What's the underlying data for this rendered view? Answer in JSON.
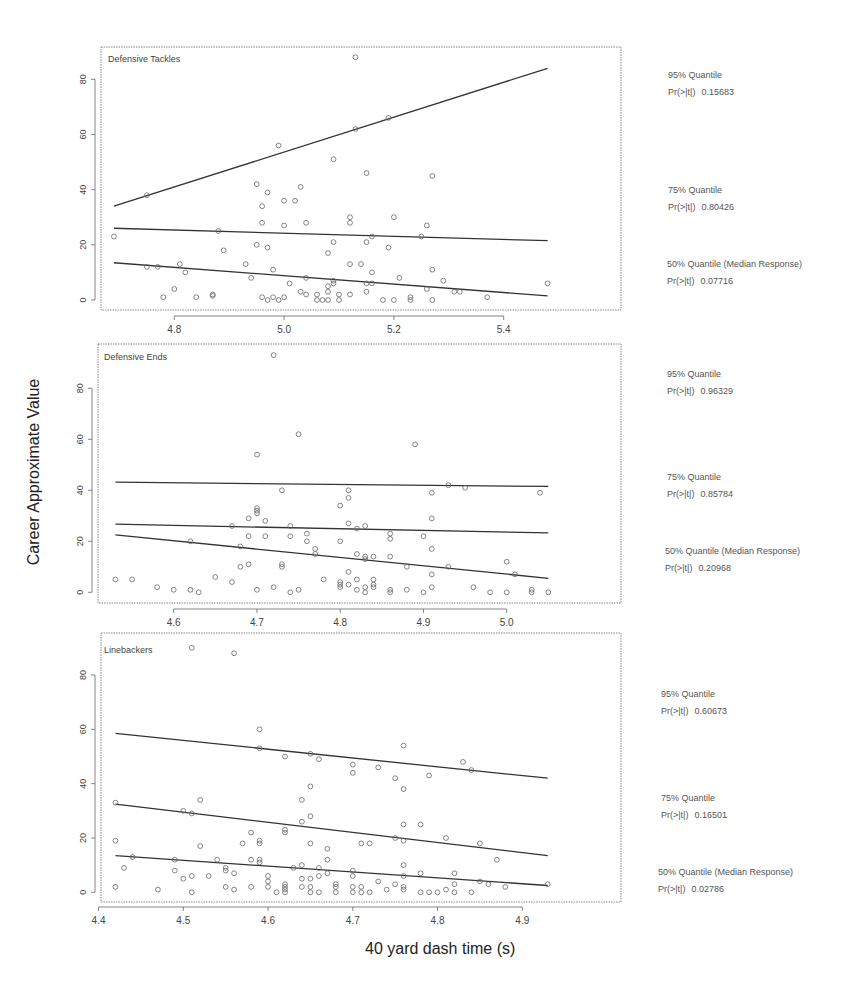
{
  "figure": {
    "ylabel": "Career Approximate Value",
    "xlabel": "40 yard dash time (s)"
  },
  "chart_data": [
    {
      "type": "scatter",
      "title": "Defensive Tackles",
      "xlabel": "40 yard dash time (s)",
      "ylabel": "Career Approximate Value",
      "xticks": [
        4.8,
        5.0,
        5.2,
        5.4
      ],
      "yticks": [
        0,
        20,
        40,
        60,
        80
      ],
      "xlim": [
        4.67,
        5.51
      ],
      "ylim": [
        -2.5,
        92
      ],
      "grid": false,
      "points": [
        [
          4.69,
          23
        ],
        [
          4.75,
          38
        ],
        [
          4.75,
          12
        ],
        [
          4.77,
          12
        ],
        [
          4.78,
          1
        ],
        [
          4.8,
          4
        ],
        [
          4.81,
          13
        ],
        [
          4.82,
          10
        ],
        [
          4.84,
          1
        ],
        [
          4.87,
          1.5
        ],
        [
          4.87,
          2
        ],
        [
          4.88,
          25
        ],
        [
          4.89,
          18
        ],
        [
          4.93,
          13
        ],
        [
          4.94,
          8
        ],
        [
          4.95,
          42
        ],
        [
          4.95,
          20
        ],
        [
          4.96,
          34
        ],
        [
          4.96,
          28
        ],
        [
          4.96,
          1
        ],
        [
          4.97,
          39
        ],
        [
          4.97,
          19
        ],
        [
          4.97,
          0
        ],
        [
          4.98,
          11
        ],
        [
          4.98,
          1
        ],
        [
          4.99,
          56
        ],
        [
          4.99,
          0
        ],
        [
          5.0,
          36
        ],
        [
          5.0,
          27
        ],
        [
          5.0,
          1
        ],
        [
          5.01,
          6
        ],
        [
          5.02,
          36
        ],
        [
          5.03,
          41
        ],
        [
          5.03,
          3
        ],
        [
          5.04,
          28
        ],
        [
          5.04,
          8
        ],
        [
          5.04,
          2
        ],
        [
          5.06,
          2
        ],
        [
          5.06,
          0
        ],
        [
          5.07,
          0
        ],
        [
          5.08,
          17
        ],
        [
          5.08,
          5
        ],
        [
          5.08,
          3
        ],
        [
          5.08,
          0
        ],
        [
          5.09,
          51
        ],
        [
          5.09,
          21
        ],
        [
          5.09,
          7
        ],
        [
          5.09,
          6
        ],
        [
          5.1,
          2
        ],
        [
          5.1,
          0
        ],
        [
          5.12,
          30
        ],
        [
          5.12,
          28
        ],
        [
          5.12,
          13
        ],
        [
          5.12,
          2
        ],
        [
          5.13,
          88
        ],
        [
          5.13,
          62
        ],
        [
          5.14,
          13
        ],
        [
          5.15,
          46
        ],
        [
          5.15,
          21
        ],
        [
          5.15,
          6
        ],
        [
          5.15,
          3
        ],
        [
          5.16,
          23
        ],
        [
          5.16,
          10
        ],
        [
          5.16,
          6
        ],
        [
          5.18,
          0
        ],
        [
          5.19,
          66
        ],
        [
          5.19,
          19
        ],
        [
          5.2,
          30
        ],
        [
          5.2,
          0
        ],
        [
          5.21,
          8
        ],
        [
          5.23,
          1
        ],
        [
          5.23,
          0
        ],
        [
          5.25,
          23
        ],
        [
          5.26,
          27
        ],
        [
          5.26,
          4
        ],
        [
          5.27,
          45
        ],
        [
          5.27,
          11
        ],
        [
          5.27,
          0
        ],
        [
          5.29,
          7
        ],
        [
          5.31,
          3
        ],
        [
          5.32,
          3
        ],
        [
          5.37,
          1
        ],
        [
          5.48,
          6
        ]
      ],
      "quantile_lines": [
        {
          "name": "95% Quantile",
          "x": [
            4.69,
            5.48
          ],
          "y": [
            34,
            84
          ],
          "p_value_label": "Pr(>|t|)",
          "p_value": "0.15683"
        },
        {
          "name": "75% Quantile",
          "x": [
            4.69,
            5.48
          ],
          "y": [
            26,
            21.5
          ],
          "p_value_label": "Pr(>|t|)",
          "p_value": "0.80426"
        },
        {
          "name": "50% Quantile (Median Response)",
          "x": [
            4.69,
            5.48
          ],
          "y": [
            13.5,
            1.5
          ],
          "p_value_label": "Pr(>|t|)",
          "p_value": "0.07716"
        }
      ]
    },
    {
      "type": "scatter",
      "title": "Defensive Ends",
      "xlabel": "40 yard dash time (s)",
      "ylabel": "Career Approximate Value",
      "xticks": [
        4.6,
        4.7,
        4.8,
        4.9,
        5.0
      ],
      "yticks": [
        0,
        20,
        40,
        60,
        80
      ],
      "xlim": [
        4.51,
        5.06
      ],
      "ylim": [
        -4,
        97
      ],
      "grid": false,
      "points": [
        [
          4.53,
          5
        ],
        [
          4.55,
          5
        ],
        [
          4.58,
          2
        ],
        [
          4.6,
          1
        ],
        [
          4.62,
          1
        ],
        [
          4.62,
          20
        ],
        [
          4.63,
          0
        ],
        [
          4.65,
          6
        ],
        [
          4.67,
          4
        ],
        [
          4.67,
          26
        ],
        [
          4.68,
          18
        ],
        [
          4.68,
          10
        ],
        [
          4.69,
          29
        ],
        [
          4.69,
          22
        ],
        [
          4.69,
          11
        ],
        [
          4.7,
          54
        ],
        [
          4.7,
          33
        ],
        [
          4.7,
          32
        ],
        [
          4.7,
          31
        ],
        [
          4.7,
          1
        ],
        [
          4.71,
          28
        ],
        [
          4.71,
          22
        ],
        [
          4.72,
          93
        ],
        [
          4.72,
          2
        ],
        [
          4.73,
          40
        ],
        [
          4.73,
          11
        ],
        [
          4.73,
          10
        ],
        [
          4.74,
          26
        ],
        [
          4.74,
          22
        ],
        [
          4.74,
          0
        ],
        [
          4.75,
          62
        ],
        [
          4.75,
          1
        ],
        [
          4.76,
          23
        ],
        [
          4.76,
          20
        ],
        [
          4.77,
          17
        ],
        [
          4.77,
          15
        ],
        [
          4.78,
          5
        ],
        [
          4.8,
          34
        ],
        [
          4.8,
          20
        ],
        [
          4.8,
          4
        ],
        [
          4.8,
          3
        ],
        [
          4.8,
          2
        ],
        [
          4.81,
          40
        ],
        [
          4.81,
          37
        ],
        [
          4.81,
          27
        ],
        [
          4.81,
          8
        ],
        [
          4.81,
          3
        ],
        [
          4.82,
          25
        ],
        [
          4.82,
          15
        ],
        [
          4.82,
          5
        ],
        [
          4.82,
          1
        ],
        [
          4.83,
          26
        ],
        [
          4.83,
          14
        ],
        [
          4.83,
          13
        ],
        [
          4.83,
          2
        ],
        [
          4.83,
          0
        ],
        [
          4.84,
          14
        ],
        [
          4.84,
          5
        ],
        [
          4.84,
          3
        ],
        [
          4.84,
          2
        ],
        [
          4.86,
          23
        ],
        [
          4.86,
          21
        ],
        [
          4.86,
          14
        ],
        [
          4.86,
          1
        ],
        [
          4.86,
          0
        ],
        [
          4.88,
          10
        ],
        [
          4.88,
          1
        ],
        [
          4.89,
          58
        ],
        [
          4.9,
          22
        ],
        [
          4.9,
          0
        ],
        [
          4.91,
          39
        ],
        [
          4.91,
          29
        ],
        [
          4.91,
          17
        ],
        [
          4.91,
          7
        ],
        [
          4.91,
          2
        ],
        [
          4.93,
          42
        ],
        [
          4.93,
          10
        ],
        [
          4.95,
          41
        ],
        [
          4.96,
          2
        ],
        [
          4.98,
          0
        ],
        [
          5.0,
          12
        ],
        [
          5.0,
          0
        ],
        [
          5.01,
          7
        ],
        [
          5.03,
          1
        ],
        [
          5.03,
          0
        ],
        [
          5.04,
          39
        ],
        [
          5.05,
          0
        ]
      ],
      "quantile_lines": [
        {
          "name": "95% Quantile",
          "x": [
            4.53,
            5.05
          ],
          "y": [
            43.2,
            41.5
          ],
          "p_value_label": "Pr(>|t|)",
          "p_value": "0.96329"
        },
        {
          "name": "75% Quantile",
          "x": [
            4.53,
            5.05
          ],
          "y": [
            26.7,
            23.3
          ],
          "p_value_label": "Pr(>|t|)",
          "p_value": "0.85784"
        },
        {
          "name": "50% Quantile (Median Response)",
          "x": [
            4.53,
            5.05
          ],
          "y": [
            22.5,
            5.5
          ],
          "p_value_label": "Pr(>|t|)",
          "p_value": "0.20968"
        }
      ]
    },
    {
      "type": "scatter",
      "title": "Linebackers",
      "xlabel": "40 yard dash time (s)",
      "ylabel": "Career Approximate Value",
      "xticks": [
        4.4,
        4.5,
        4.6,
        4.7,
        4.8,
        4.9
      ],
      "yticks": [
        0,
        20,
        40,
        60,
        80
      ],
      "xlim": [
        4.4,
        4.95
      ],
      "ylim": [
        -4,
        94
      ],
      "grid": false,
      "points": [
        [
          4.42,
          19
        ],
        [
          4.42,
          2
        ],
        [
          4.42,
          33
        ],
        [
          4.43,
          9
        ],
        [
          4.44,
          13
        ],
        [
          4.47,
          1
        ],
        [
          4.49,
          12
        ],
        [
          4.49,
          8
        ],
        [
          4.5,
          30
        ],
        [
          4.5,
          5
        ],
        [
          4.51,
          90
        ],
        [
          4.51,
          29
        ],
        [
          4.51,
          6
        ],
        [
          4.51,
          0
        ],
        [
          4.52,
          34
        ],
        [
          4.52,
          17
        ],
        [
          4.53,
          6
        ],
        [
          4.54,
          12
        ],
        [
          4.55,
          9
        ],
        [
          4.55,
          8
        ],
        [
          4.55,
          2
        ],
        [
          4.56,
          88
        ],
        [
          4.56,
          7
        ],
        [
          4.56,
          1
        ],
        [
          4.57,
          18
        ],
        [
          4.58,
          22
        ],
        [
          4.58,
          12
        ],
        [
          4.58,
          2
        ],
        [
          4.59,
          60
        ],
        [
          4.59,
          53
        ],
        [
          4.59,
          19
        ],
        [
          4.59,
          18
        ],
        [
          4.59,
          12
        ],
        [
          4.59,
          11
        ],
        [
          4.6,
          6
        ],
        [
          4.6,
          4
        ],
        [
          4.6,
          2
        ],
        [
          4.61,
          0
        ],
        [
          4.62,
          50
        ],
        [
          4.62,
          23
        ],
        [
          4.62,
          22
        ],
        [
          4.62,
          3
        ],
        [
          4.62,
          2
        ],
        [
          4.62,
          1
        ],
        [
          4.62,
          0
        ],
        [
          4.63,
          9
        ],
        [
          4.64,
          34
        ],
        [
          4.64,
          26
        ],
        [
          4.64,
          10
        ],
        [
          4.64,
          5
        ],
        [
          4.64,
          2
        ],
        [
          4.65,
          51
        ],
        [
          4.65,
          39
        ],
        [
          4.65,
          28
        ],
        [
          4.65,
          18
        ],
        [
          4.65,
          5
        ],
        [
          4.65,
          2
        ],
        [
          4.65,
          0
        ],
        [
          4.66,
          49
        ],
        [
          4.66,
          9
        ],
        [
          4.66,
          6
        ],
        [
          4.66,
          0
        ],
        [
          4.67,
          16
        ],
        [
          4.67,
          12
        ],
        [
          4.67,
          7
        ],
        [
          4.68,
          3
        ],
        [
          4.68,
          2
        ],
        [
          4.68,
          0
        ],
        [
          4.7,
          47
        ],
        [
          4.7,
          44
        ],
        [
          4.7,
          8
        ],
        [
          4.7,
          6
        ],
        [
          4.7,
          2
        ],
        [
          4.7,
          0
        ],
        [
          4.71,
          18
        ],
        [
          4.71,
          2
        ],
        [
          4.71,
          0
        ],
        [
          4.72,
          18
        ],
        [
          4.72,
          0
        ],
        [
          4.73,
          46
        ],
        [
          4.73,
          4
        ],
        [
          4.74,
          1
        ],
        [
          4.75,
          42
        ],
        [
          4.75,
          20
        ],
        [
          4.75,
          3
        ],
        [
          4.76,
          54
        ],
        [
          4.76,
          38
        ],
        [
          4.76,
          25
        ],
        [
          4.76,
          19
        ],
        [
          4.76,
          10
        ],
        [
          4.76,
          6
        ],
        [
          4.76,
          2
        ],
        [
          4.76,
          1
        ],
        [
          4.78,
          25
        ],
        [
          4.78,
          7
        ],
        [
          4.78,
          0
        ],
        [
          4.79,
          43
        ],
        [
          4.79,
          0
        ],
        [
          4.8,
          0
        ],
        [
          4.81,
          20
        ],
        [
          4.81,
          1
        ],
        [
          4.82,
          7
        ],
        [
          4.82,
          3
        ],
        [
          4.82,
          0
        ],
        [
          4.83,
          48
        ],
        [
          4.84,
          45
        ],
        [
          4.84,
          0
        ],
        [
          4.85,
          18
        ],
        [
          4.85,
          4
        ],
        [
          4.86,
          3
        ],
        [
          4.87,
          12
        ],
        [
          4.88,
          2
        ],
        [
          4.93,
          3
        ]
      ],
      "quantile_lines": [
        {
          "name": "95% Quantile",
          "x": [
            4.42,
            4.93
          ],
          "y": [
            58.5,
            42
          ],
          "p_value_label": "Pr(>|t|)",
          "p_value": "0.60673"
        },
        {
          "name": "75% Quantile",
          "x": [
            4.42,
            4.93
          ],
          "y": [
            32.5,
            13.5
          ],
          "p_value_label": "Pr(>|t|)",
          "p_value": "0.16501"
        },
        {
          "name": "50% Quantile (Median Response)",
          "x": [
            4.42,
            4.93
          ],
          "y": [
            13.5,
            2.5
          ],
          "p_value_label": "Pr(>|t|)",
          "p_value": "0.02786"
        }
      ]
    }
  ]
}
